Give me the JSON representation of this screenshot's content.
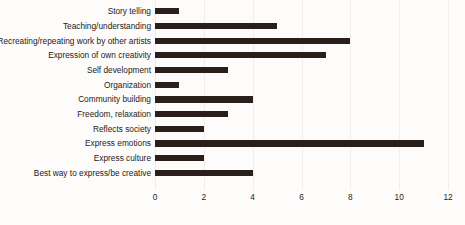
{
  "chart_data": {
    "type": "bar",
    "orientation": "horizontal",
    "title": "",
    "xlabel": "",
    "ylabel": "",
    "xlim": [
      0,
      12
    ],
    "xticks": [
      0,
      2,
      4,
      6,
      8,
      10,
      12
    ],
    "grid": true,
    "legend": false,
    "bar_color": "#2a201b",
    "background_color": "#fdfcfb",
    "gridline_color": "#f1efee",
    "categories": [
      "Story telling",
      "Teaching/understanding",
      "Recreating/repeating work by other artists",
      "Expression of own creativity",
      "Self development",
      "Organization",
      "Community building",
      "Freedom, relaxation",
      "Reflects society",
      "Express emotions",
      "Express culture",
      "Best way to express/be creative"
    ],
    "values": [
      1,
      5,
      8,
      7,
      3,
      1,
      4,
      3,
      2,
      11,
      2,
      4
    ]
  }
}
